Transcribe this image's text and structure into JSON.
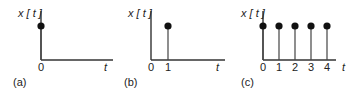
{
  "panels": [
    {
      "id": "a",
      "caption": "(a)",
      "ylabel": "x [ t ]",
      "xlabel": "t",
      "ticks": [
        "0"
      ],
      "samples": [
        {
          "t": 0,
          "value": 1
        }
      ]
    },
    {
      "id": "b",
      "caption": "(b)",
      "ylabel": "x [ t ]",
      "xlabel": "t",
      "ticks": [
        "0",
        "1"
      ],
      "samples": [
        {
          "t": 1,
          "value": 1
        }
      ]
    },
    {
      "id": "c",
      "caption": "(c)",
      "ylabel": "x [ t ]",
      "xlabel": "t",
      "ticks": [
        "0",
        "1",
        "2",
        "3",
        "4"
      ],
      "samples": [
        {
          "t": 0,
          "value": 1
        },
        {
          "t": 1,
          "value": 1
        },
        {
          "t": 2,
          "value": 1
        },
        {
          "t": 3,
          "value": 1
        },
        {
          "t": 4,
          "value": 1
        }
      ]
    }
  ]
}
